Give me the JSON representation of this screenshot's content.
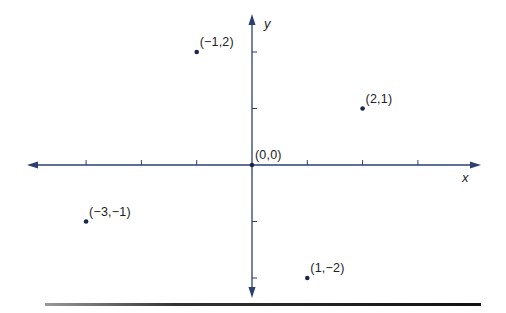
{
  "chart_data": {
    "type": "scatter",
    "title": "",
    "xlabel": "x",
    "ylabel": "y",
    "xlim": [
      -3,
      4
    ],
    "ylim": [
      -2,
      2
    ],
    "grid": false,
    "x_ticks": [
      -3,
      -2,
      -1,
      1,
      2,
      3
    ],
    "y_ticks": [
      -2,
      -1,
      1,
      2
    ],
    "points": [
      {
        "x": -1,
        "y": 2,
        "label": "(−1,2)"
      },
      {
        "x": 2,
        "y": 1,
        "label": "(2,1)"
      },
      {
        "x": 0,
        "y": 0,
        "label": "(0,0)"
      },
      {
        "x": -3,
        "y": -1,
        "label": "(−3,−1)"
      },
      {
        "x": 1,
        "y": -2,
        "label": "(1,−2)"
      }
    ],
    "colors": {
      "axis": "#2b3f73",
      "point": "#1a2550"
    }
  },
  "axes": {
    "x_label": "x",
    "y_label": "y"
  }
}
